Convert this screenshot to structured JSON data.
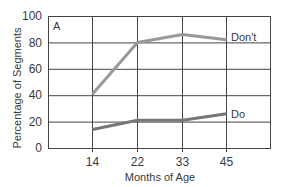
{
  "chart_data": {
    "type": "line",
    "panel_label": "A",
    "xlabel": "Months of Age",
    "ylabel": "Percentage of Segments",
    "ylim": [
      0,
      100
    ],
    "yticks": [
      "0",
      "20",
      "40",
      "60",
      "80",
      "100"
    ],
    "categories": [
      "14",
      "22",
      "33",
      "45"
    ],
    "grid": true,
    "series": [
      {
        "name": "Don't",
        "values": [
          41,
          80,
          86,
          82
        ],
        "color": "#999999"
      },
      {
        "name": "Do",
        "values": [
          14,
          21,
          21,
          26
        ],
        "color": "#777777"
      }
    ]
  }
}
